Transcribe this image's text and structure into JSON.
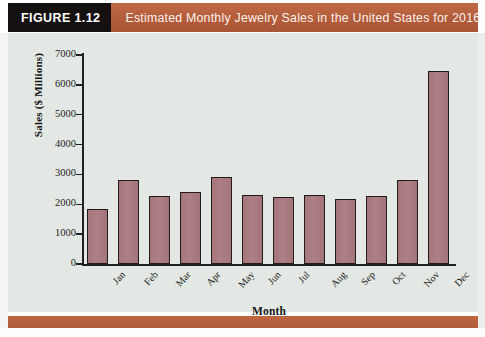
{
  "banner": {
    "tag": "FIGURE 1.12",
    "title": "Estimated Monthly Jewelry Sales in the United States for 2016"
  },
  "colors": {
    "banner": "#b9623f",
    "tag_background": "#141110",
    "bar_fill": "#a8787c",
    "bar_stroke": "#231c1c",
    "plot_background": "#e3e8e4",
    "axis": "#20201f"
  },
  "chart_data": {
    "type": "bar",
    "title": "Estimated Monthly Jewelry Sales in the United States for 2016",
    "xlabel": "Month",
    "ylabel": "Sales ($ Millions)",
    "categories": [
      "Jan",
      "Feb",
      "Mar",
      "Apr",
      "May",
      "Jun",
      "Jul",
      "Aug",
      "Sep",
      "Oct",
      "Nov",
      "Dec"
    ],
    "values": [
      1830,
      2800,
      2280,
      2400,
      2900,
      2300,
      2230,
      2300,
      2180,
      2270,
      2830,
      6450
    ],
    "ylim": [
      0,
      7000
    ],
    "yticks": [
      0,
      1000,
      2000,
      3000,
      4000,
      5000,
      6000,
      7000
    ],
    "ytick_labels": [
      "0",
      "1000",
      "2000",
      "3000",
      "4000",
      "5000",
      "6000",
      "7000"
    ],
    "grid": false,
    "legend": false
  }
}
